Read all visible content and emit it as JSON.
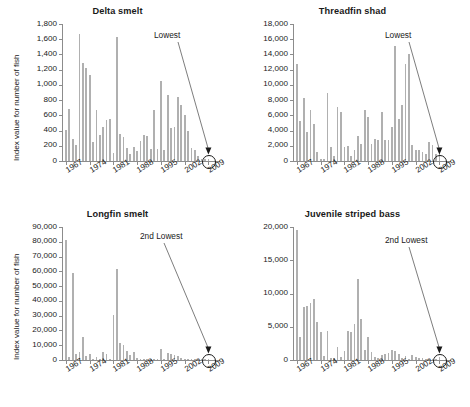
{
  "figure": {
    "ylabel": "Index value for number of fish",
    "xticks": [
      "1967",
      "1974",
      "1981",
      "1988",
      "1995",
      "2002",
      "2009"
    ],
    "bar_color": "#b0b0b0",
    "axis_color": "#8c8c8c",
    "text_color": "#1a1a1a"
  },
  "chart_data": [
    {
      "type": "bar",
      "title": "Delta smelt",
      "xlabel": "",
      "ylabel": "Index value for number of fish",
      "ylim": [
        0,
        1800
      ],
      "ytick_values": [
        0,
        200,
        400,
        600,
        800,
        1000,
        1200,
        1400,
        1600,
        1800
      ],
      "ytick_labels": [
        "0",
        "200",
        "400",
        "600",
        "800",
        "1,000",
        "1,200",
        "1,400",
        "1,600",
        "1,800"
      ],
      "grid": false,
      "legend": "none",
      "x_start_year": 1967,
      "categories": [
        1967,
        1968,
        1969,
        1970,
        1971,
        1972,
        1973,
        1974,
        1975,
        1976,
        1977,
        1978,
        1979,
        1980,
        1981,
        1982,
        1983,
        1984,
        1985,
        1986,
        1987,
        1988,
        1989,
        1990,
        1991,
        1992,
        1993,
        1994,
        1995,
        1996,
        1997,
        1998,
        1999,
        2000,
        2001,
        2002,
        2003,
        2004,
        2005,
        2006,
        2007,
        2008,
        2009
      ],
      "values": [
        405,
        680,
        295,
        210,
        1665,
        1290,
        1225,
        1130,
        245,
        675,
        340,
        450,
        535,
        555,
        100,
        1630,
        350,
        310,
        165,
        95,
        185,
        130,
        260,
        345,
        335,
        160,
        665,
        155,
        1050,
        145,
        870,
        430,
        450,
        840,
        735,
        605,
        400,
        175,
        140,
        60,
        30,
        25,
        20
      ],
      "annotation": {
        "text": "Lowest",
        "points_to_year": 2009
      }
    },
    {
      "type": "bar",
      "title": "Threadfin shad",
      "xlabel": "",
      "ylabel": "Index value for number of fish",
      "ylim": [
        0,
        18000
      ],
      "ytick_values": [
        0,
        2000,
        4000,
        6000,
        8000,
        10000,
        12000,
        14000,
        16000,
        18000
      ],
      "ytick_labels": [
        "0",
        "2,000",
        "4,000",
        "6,000",
        "8,000",
        "10,000",
        "12,000",
        "14,000",
        "16,000",
        "18,000"
      ],
      "grid": false,
      "legend": "none",
      "x_start_year": 1967,
      "categories": [
        1967,
        1968,
        1969,
        1970,
        1971,
        1972,
        1973,
        1974,
        1975,
        1976,
        1977,
        1978,
        1979,
        1980,
        1981,
        1982,
        1983,
        1984,
        1985,
        1986,
        1987,
        1988,
        1989,
        1990,
        1991,
        1992,
        1993,
        1994,
        1995,
        1996,
        1997,
        1998,
        1999,
        2000,
        2001,
        2002,
        2003,
        2004,
        2005,
        2006,
        2007,
        2008,
        2009
      ],
      "values": [
        12700,
        5200,
        8250,
        3850,
        6700,
        4850,
        1150,
        300,
        250,
        8900,
        1850,
        700,
        7100,
        6400,
        1900,
        1950,
        650,
        1400,
        3250,
        2200,
        6750,
        5750,
        2250,
        2850,
        2800,
        6400,
        2700,
        2700,
        4450,
        15100,
        5550,
        7350,
        12750,
        14100,
        2100,
        1400,
        1500,
        1250,
        900,
        2550,
        2150,
        900,
        1100
      ],
      "annotation": {
        "text": "Lowest",
        "points_to_year": 2009
      }
    },
    {
      "type": "bar",
      "title": "Longfin smelt",
      "xlabel": "",
      "ylabel": "Index value for number of fish",
      "ylim": [
        0,
        90000
      ],
      "ytick_values": [
        0,
        10000,
        20000,
        30000,
        40000,
        50000,
        60000,
        70000,
        80000,
        90000
      ],
      "ytick_labels": [
        "0",
        "10,000",
        "20,000",
        "30,000",
        "40,000",
        "50,000",
        "60,000",
        "70,000",
        "80,000",
        "90,000"
      ],
      "grid": false,
      "legend": "none",
      "x_start_year": 1967,
      "categories": [
        1967,
        1968,
        1969,
        1970,
        1971,
        1972,
        1973,
        1974,
        1975,
        1976,
        1977,
        1978,
        1979,
        1980,
        1981,
        1982,
        1983,
        1984,
        1985,
        1986,
        1987,
        1988,
        1989,
        1990,
        1991,
        1992,
        1993,
        1994,
        1995,
        1996,
        1997,
        1998,
        1999,
        2000,
        2001,
        2002,
        2003,
        2004,
        2005,
        2006,
        2007,
        2008,
        2009
      ],
      "values": [
        81500,
        2100,
        59200,
        3800,
        5300,
        15800,
        2600,
        4300,
        900,
        1800,
        350,
        5300,
        4200,
        900,
        30400,
        61800,
        11200,
        10000,
        5800,
        3600,
        5600,
        1400,
        800,
        700,
        500,
        300,
        250,
        200,
        7400,
        600,
        4700,
        4100,
        3200,
        2600,
        1400,
        800,
        500,
        400,
        300,
        250,
        200,
        150,
        900
      ],
      "annotation": {
        "text": "2nd Lowest",
        "points_to_year": 2009
      }
    },
    {
      "type": "bar",
      "title": "Juvenile striped bass",
      "xlabel": "",
      "ylabel": "Index value for number of fish",
      "ylim": [
        0,
        20000
      ],
      "ytick_values": [
        0,
        5000,
        10000,
        15000,
        20000
      ],
      "ytick_labels": [
        "0",
        "5,000",
        "10,000",
        "15,000",
        "20,000"
      ],
      "grid": false,
      "legend": "none",
      "x_start_year": 1967,
      "categories": [
        1967,
        1968,
        1969,
        1970,
        1971,
        1972,
        1973,
        1974,
        1975,
        1976,
        1977,
        1978,
        1979,
        1980,
        1981,
        1982,
        1983,
        1984,
        1985,
        1986,
        1987,
        1988,
        1989,
        1990,
        1991,
        1992,
        1993,
        1994,
        1995,
        1996,
        1997,
        1998,
        1999,
        2000,
        2001,
        2002,
        2003,
        2004,
        2005,
        2006,
        2007,
        2008,
        2009
      ],
      "values": [
        19600,
        3400,
        7900,
        8100,
        8500,
        9250,
        5700,
        4200,
        650,
        4400,
        300,
        250,
        1900,
        450,
        1350,
        4300,
        4200,
        5400,
        12150,
        6200,
        1500,
        3500,
        1200,
        450,
        350,
        800,
        900,
        1100,
        1450,
        1300,
        900,
        250,
        600,
        200,
        800,
        400,
        350,
        250,
        100,
        80,
        60,
        50,
        500
      ],
      "annotation": {
        "text": "2nd Lowest",
        "points_to_year": 2009
      }
    }
  ]
}
